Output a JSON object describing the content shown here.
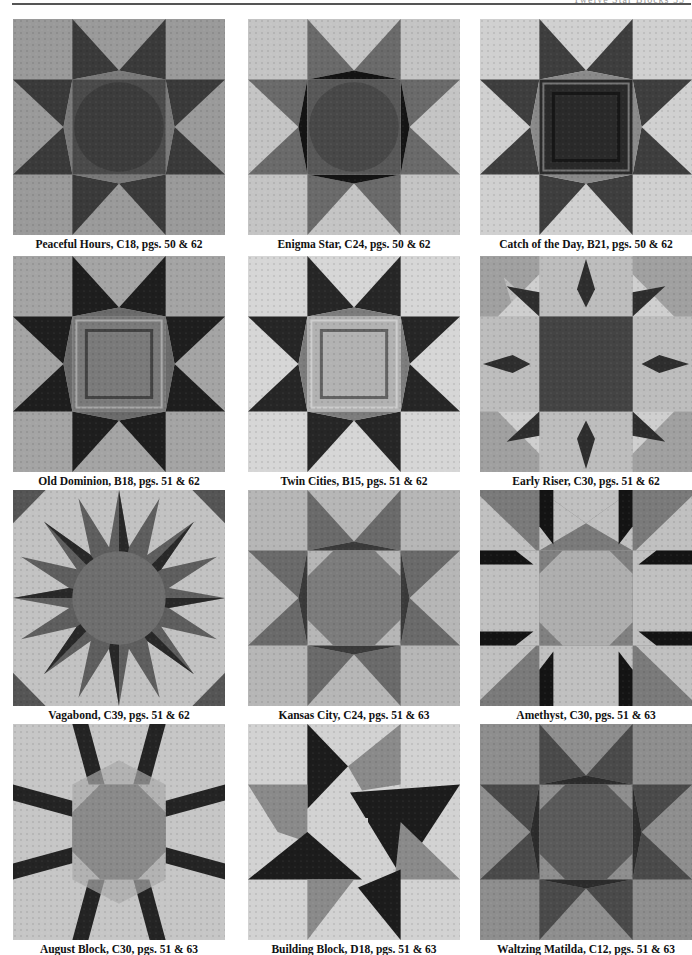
{
  "page": {
    "header_text": "Twelve Star Blocks 53"
  },
  "blocks": [
    {
      "name": "Peaceful Hours",
      "code": "C18",
      "pages": "pgs. 50 & 62",
      "caption": "Peaceful Hours, C18, pgs. 50 & 62",
      "bg": "#9a9a9a",
      "star": "#3a3a3a",
      "center": "#4a4a4a",
      "accent": "#7a7a7a",
      "style": "sawtooth"
    },
    {
      "name": "Enigma Star",
      "code": "C24",
      "pages": "pgs. 50 & 62",
      "caption": "Enigma Star, C24, pgs. 50 & 62",
      "bg": "#c4c4c4",
      "star": "#6a6a6a",
      "center": "#585858",
      "accent": "#141414",
      "style": "sawtooth"
    },
    {
      "name": "Catch of the Day",
      "code": "B21",
      "pages": "pgs. 50 & 62",
      "caption": "Catch of the Day, B21, pgs. 50 & 62",
      "bg": "#d0d0d0",
      "star": "#3e3e3e",
      "center": "#2a2a2a",
      "accent": "#8a8a8a",
      "style": "sawtooth-square"
    },
    {
      "name": "Old Dominion",
      "code": "B18",
      "pages": "pgs. 51 & 62",
      "caption": "Old Dominion, B18, pgs. 51 & 62",
      "bg": "#a4a4a4",
      "star": "#1e1e1e",
      "center": "#7a7a7a",
      "accent": "#6a6a6a",
      "style": "sawtooth-square"
    },
    {
      "name": "Twin Cities",
      "code": "B15",
      "pages": "pgs. 51 & 62",
      "caption": "Twin Cities, B15, pgs. 51 & 62",
      "bg": "#d6d6d6",
      "star": "#262626",
      "center": "#b2b2b2",
      "accent": "#7c7c7c",
      "style": "sawtooth-square"
    },
    {
      "name": "Early Riser",
      "code": "C30",
      "pages": "pgs. 51 & 62",
      "caption": "Early Riser, C30, pgs. 51 & 62",
      "bg": "#a0a0a0",
      "star": "#bdbdbd",
      "center": "#444444",
      "accent": "#2e2e2e",
      "style": "early-riser"
    },
    {
      "name": "Vagabond",
      "code": "C39",
      "pages": "pgs. 51 & 62",
      "caption": "Vagabond, C39, pgs. 51 & 62",
      "bg": "#c2c2c2",
      "star": "#5e5e5e",
      "center": "#6e6e6e",
      "accent": "#1a1a1a",
      "style": "vagabond"
    },
    {
      "name": "Kansas City",
      "code": "C24",
      "pages": "pgs. 51 & 63",
      "caption": "Kansas City, C24, pgs. 51 & 63",
      "bg": "#b6b6b6",
      "star": "#6a6a6a",
      "center": "#7c7c7c",
      "accent": "#3a3a3a",
      "style": "octagon"
    },
    {
      "name": "Amethyst",
      "code": "C30",
      "pages": "pgs. 51 & 63",
      "caption": "Amethyst, C30, pgs. 51 & 63",
      "bg": "#7a7a7a",
      "star": "#c0c0c0",
      "center": "#aeaeae",
      "accent": "#141414",
      "style": "amethyst"
    },
    {
      "name": "August Block",
      "code": "C30",
      "pages": "pgs. 51 & 63",
      "caption": "August Block, C30, pgs. 51 & 63",
      "bg": "#c6c6c6",
      "star": "#242424",
      "center": "#8a8a8a",
      "accent": "#aaaaaa",
      "style": "lemoyne"
    },
    {
      "name": "Building Block",
      "code": "D18",
      "pages": "pgs. 51 & 63",
      "caption": "Building Block, D18, pgs. 51 & 63",
      "bg": "#d2d2d2",
      "star": "#1c1c1c",
      "center": "#d2d2d2",
      "accent": "#8a8a8a",
      "style": "pinwheel"
    },
    {
      "name": "Waltzing Matilda",
      "code": "C12",
      "pages": "pgs. 51 & 63",
      "caption": "Waltzing Matilda, C12, pgs. 51 & 63",
      "bg": "#8e8e8e",
      "star": "#4a4a4a",
      "center": "#5a5a5a",
      "accent": "#2c2c2c",
      "style": "octagon"
    }
  ],
  "layout": {
    "columns_x": [
      13,
      248,
      480
    ],
    "rows_y": [
      19,
      256,
      490,
      724
    ],
    "caption_offset": 219
  }
}
